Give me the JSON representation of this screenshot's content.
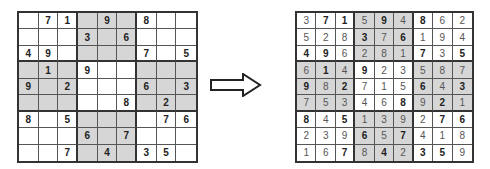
{
  "puzzle": {
    "label": "unsolved",
    "rows": [
      [
        "",
        "7",
        "1",
        "",
        "9",
        "",
        "8",
        "",
        ""
      ],
      [
        "",
        "",
        "",
        "3",
        "",
        "6",
        "",
        "",
        ""
      ],
      [
        "4",
        "9",
        "",
        "",
        "",
        "",
        "7",
        "",
        "5"
      ],
      [
        "",
        "1",
        "",
        "9",
        "",
        "",
        "",
        "",
        ""
      ],
      [
        "9",
        "",
        "2",
        "",
        "",
        "",
        "6",
        "",
        "3"
      ],
      [
        "",
        "",
        "",
        "",
        "",
        "8",
        "",
        "2",
        ""
      ],
      [
        "8",
        "",
        "5",
        "",
        "",
        "",
        "",
        "7",
        "6"
      ],
      [
        "",
        "",
        "",
        "6",
        "",
        "7",
        "",
        "",
        ""
      ],
      [
        "",
        "",
        "7",
        "",
        "4",
        "",
        "3",
        "5",
        ""
      ]
    ]
  },
  "solution": {
    "label": "solved",
    "rows": [
      [
        "3",
        "7",
        "1",
        "5",
        "9",
        "4",
        "8",
        "6",
        "2"
      ],
      [
        "5",
        "2",
        "8",
        "3",
        "7",
        "6",
        "1",
        "9",
        "4"
      ],
      [
        "4",
        "9",
        "6",
        "2",
        "8",
        "1",
        "7",
        "3",
        "5"
      ],
      [
        "6",
        "1",
        "4",
        "9",
        "2",
        "3",
        "5",
        "8",
        "7"
      ],
      [
        "9",
        "8",
        "2",
        "7",
        "1",
        "5",
        "6",
        "4",
        "3"
      ],
      [
        "7",
        "5",
        "3",
        "4",
        "6",
        "8",
        "9",
        "2",
        "1"
      ],
      [
        "8",
        "4",
        "5",
        "1",
        "3",
        "9",
        "2",
        "7",
        "6"
      ],
      [
        "2",
        "3",
        "9",
        "6",
        "5",
        "7",
        "4",
        "1",
        "8"
      ],
      [
        "1",
        "6",
        "7",
        "8",
        "4",
        "2",
        "3",
        "5",
        "9"
      ]
    ]
  },
  "arrow": {
    "icon": "right-arrow-icon",
    "direction": "right"
  },
  "colors": {
    "shaded_box": "#d6d6d6",
    "grid_line": "#333333",
    "background": "#ffffff"
  },
  "shaded_boxes": [
    [
      0,
      1
    ],
    [
      1,
      0
    ],
    [
      1,
      2
    ],
    [
      2,
      1
    ]
  ]
}
